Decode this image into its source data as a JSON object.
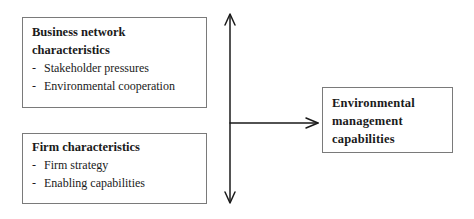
{
  "diagram": {
    "type": "conceptual-framework",
    "boxes": [
      {
        "id": "business-network",
        "title_lines": [
          "Business network",
          "characteristics"
        ],
        "items": [
          "Stakeholder pressures",
          "Environmental cooperation"
        ]
      },
      {
        "id": "firm",
        "title_lines": [
          "Firm characteristics"
        ],
        "items": [
          "Firm strategy",
          "Enabling capabilities"
        ]
      },
      {
        "id": "outcome",
        "title_lines": [
          "Environmental",
          "management",
          "capabilities"
        ],
        "items": []
      }
    ],
    "bullet": "-",
    "connectors": [
      {
        "type": "double-headed-vertical-arrow",
        "from": "top",
        "to": "bottom"
      },
      {
        "type": "arrow",
        "from": "vertical-arrow",
        "to": "outcome"
      }
    ],
    "line_color": "#1a1a1a",
    "border_color": "#7a7a7a"
  }
}
